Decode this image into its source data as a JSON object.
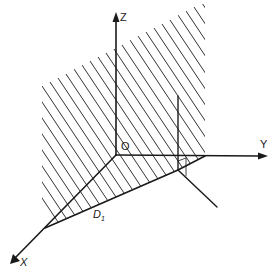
{
  "diagram": {
    "type": "3d-coordinate-axes-with-hatched-half-plane",
    "axes": [
      {
        "name": "Z",
        "label": "Z",
        "direction": "up"
      },
      {
        "name": "Y",
        "label": "Y",
        "direction": "right"
      },
      {
        "name": "X",
        "label": "X",
        "direction": "down-left"
      }
    ],
    "origin_label": "O",
    "region_label": "D",
    "region_label_sub": "1",
    "colors": {
      "ink": "#1a1a1a",
      "hatch": "#333333",
      "background": "#ffffff"
    }
  }
}
